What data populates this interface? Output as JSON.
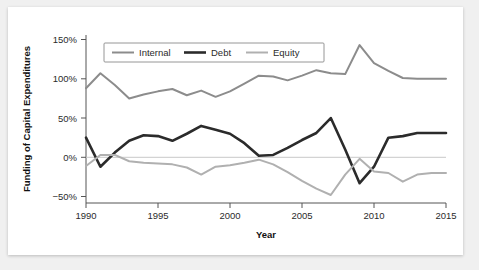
{
  "chart_data": {
    "type": "line",
    "title": "",
    "xlabel": "Year",
    "ylabel": "Funding of Capital Expenditures",
    "xlim": [
      1990,
      2015
    ],
    "ylim": [
      -62,
      152
    ],
    "xticks": [
      1990,
      1995,
      2000,
      2005,
      2010,
      2015
    ],
    "xtick_labels": [
      "1990",
      "1995",
      "2000",
      "2005",
      "2010",
      "2015"
    ],
    "yticks": [
      -50,
      0,
      50,
      100,
      150
    ],
    "ytick_labels": [
      "−50%",
      "0%",
      "50%",
      "100%",
      "150%"
    ],
    "grid": false,
    "zero_reference_line": true,
    "legend_position": "top-inside",
    "x": [
      1990,
      1991,
      1992,
      1993,
      1994,
      1995,
      1996,
      1997,
      1998,
      1999,
      2000,
      2001,
      2002,
      2003,
      2004,
      2005,
      2006,
      2007,
      2008,
      2009,
      2010,
      2011,
      2012,
      2013,
      2014,
      2015
    ],
    "series": [
      {
        "name": "Internal",
        "color": "#8c8c8c",
        "width": 2.0,
        "values": [
          88,
          107,
          92,
          75,
          80,
          84,
          87,
          79,
          85,
          77,
          84,
          94,
          104,
          103,
          98,
          104,
          111,
          107,
          106,
          143,
          120,
          110,
          101,
          100,
          100,
          100
        ]
      },
      {
        "name": "Debt",
        "color": "#2b2b2b",
        "width": 2.6,
        "values": [
          25,
          -12,
          6,
          21,
          28,
          27,
          21,
          30,
          40,
          35,
          30,
          18,
          2,
          3,
          12,
          22,
          31,
          50,
          10,
          -33,
          -12,
          25,
          27,
          31,
          31,
          31
        ]
      },
      {
        "name": "Equity",
        "color": "#b0b0b0",
        "width": 2.0,
        "values": [
          -11,
          3,
          3,
          -5,
          -7,
          -8,
          -9,
          -13,
          -22,
          -12,
          -10,
          -7,
          -3,
          -9,
          -19,
          -30,
          -40,
          -48,
          -22,
          -2,
          -18,
          -20,
          -31,
          -22,
          -20,
          -20
        ]
      }
    ],
    "legend": [
      {
        "label": "Internal",
        "color": "#8c8c8c"
      },
      {
        "label": "Debt",
        "color": "#2b2b2b"
      },
      {
        "label": "Equity",
        "color": "#b0b0b0"
      }
    ]
  }
}
